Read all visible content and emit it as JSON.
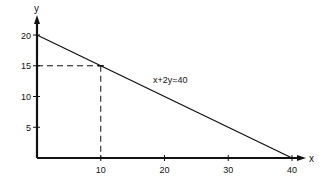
{
  "chart_data": {
    "type": "line",
    "title": "",
    "xlabel": "x",
    "ylabel": "y",
    "xlim": [
      0,
      40
    ],
    "ylim": [
      0,
      20
    ],
    "grid": false,
    "legend": null,
    "x_ticks": [
      10,
      20,
      30,
      40
    ],
    "y_ticks": [
      5,
      10,
      15,
      20
    ],
    "x_tick_labels": [
      "10",
      "20",
      "30",
      "40"
    ],
    "y_tick_labels": [
      "5",
      "10",
      "15",
      "20"
    ],
    "series": [
      {
        "name": "x+2y=40",
        "x": [
          0,
          40
        ],
        "y": [
          20,
          0
        ],
        "style": "solid"
      }
    ],
    "annotations": [
      {
        "type": "text",
        "text": "x+2y=40",
        "x": 25,
        "y": 12.5
      },
      {
        "type": "point",
        "x": 10,
        "y": 15,
        "guides": "dashed lines to both axes"
      }
    ]
  },
  "labels": {
    "x_axis": "x",
    "y_axis": "y",
    "equation": "x+2y=40"
  },
  "colors": {
    "ink": "#111111",
    "background": "#ffffff"
  }
}
